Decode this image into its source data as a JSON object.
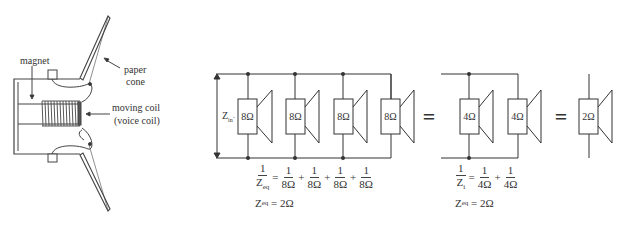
{
  "speaker_cross_section": {
    "labels": {
      "magnet": "magnet",
      "paper_cone_line1": "paper",
      "paper_cone_line2": "cone",
      "moving_coil_line1": "moving coil",
      "moving_coil_line2": "(voice coil)"
    }
  },
  "circuit_1": {
    "zin_label": "Z",
    "zin_sub": "in",
    "speakers": [
      {
        "impedance": "8Ω"
      },
      {
        "impedance": "8Ω"
      },
      {
        "impedance": "8Ω"
      },
      {
        "impedance": "8Ω"
      }
    ],
    "equation": {
      "lhs_num": "1",
      "lhs_den": "Z",
      "lhs_den_sub": "eq",
      "terms": [
        "8Ω",
        "8Ω",
        "8Ω",
        "8Ω"
      ],
      "term_num": "1",
      "result_lhs": "Z",
      "result_sub": "eq",
      "result_rhs": "= 2Ω"
    }
  },
  "equals_1": "=",
  "circuit_2": {
    "speakers": [
      {
        "impedance": "4Ω"
      },
      {
        "impedance": "4Ω"
      }
    ],
    "equation": {
      "lhs_num": "1",
      "lhs_den": "Z",
      "lhs_den_sub": "i",
      "terms": [
        "4Ω",
        "4Ω"
      ],
      "term_num": "1",
      "result_lhs": "Z",
      "result_sub": "eq",
      "result_rhs": "= 2Ω"
    }
  },
  "equals_2": "=",
  "circuit_3": {
    "speakers": [
      {
        "impedance": "2Ω"
      }
    ]
  }
}
